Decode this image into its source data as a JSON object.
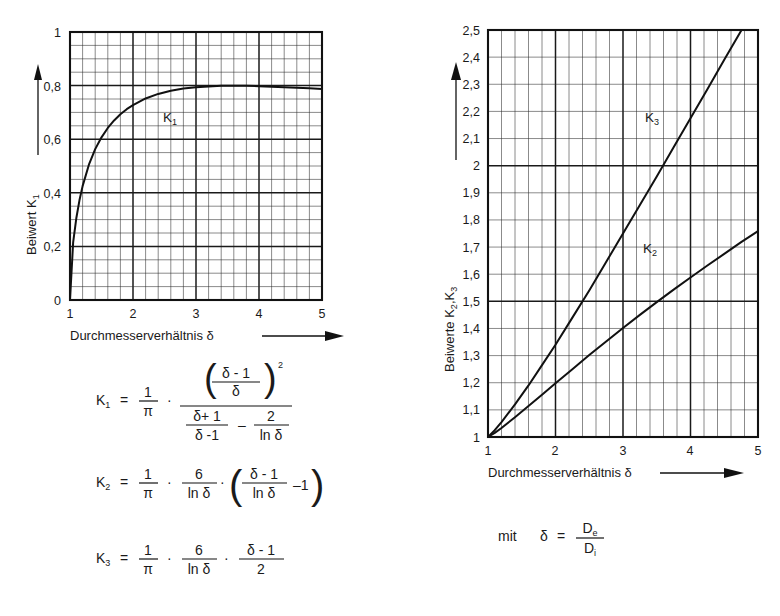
{
  "chart_data": [
    {
      "type": "line",
      "id": "left",
      "title": "",
      "xlabel": "Durchmesserverhältnis δ",
      "ylabel": "Beiwert  K₁",
      "xlim": [
        1,
        5
      ],
      "ylim": [
        0,
        1
      ],
      "grid": true,
      "x_ticks": [
        "1",
        "2",
        "3",
        "4",
        "5"
      ],
      "y_ticks": [
        "0",
        "0,2",
        "0,4",
        "0,6",
        "0,8",
        "1"
      ],
      "x_minor_step": 0.2,
      "y_minor_step": 0.05,
      "legend_position": "inline",
      "series": [
        {
          "name": "K₁",
          "label_x": 2.2,
          "label_y": 0.68,
          "x": [
            1.0,
            1.05,
            1.1,
            1.15,
            1.2,
            1.3,
            1.4,
            1.5,
            1.6,
            1.7,
            1.8,
            1.9,
            2.0,
            2.2,
            2.4,
            2.6,
            2.8,
            3.0,
            3.2,
            3.4,
            3.6,
            3.8,
            4.0,
            4.2,
            4.4,
            4.6,
            4.8,
            5.0
          ],
          "values": [
            0.0,
            0.215,
            0.305,
            0.372,
            0.425,
            0.505,
            0.563,
            0.607,
            0.642,
            0.67,
            0.693,
            0.712,
            0.727,
            0.752,
            0.769,
            0.781,
            0.789,
            0.794,
            0.797,
            0.799,
            0.799,
            0.799,
            0.798,
            0.796,
            0.794,
            0.792,
            0.79,
            0.787
          ]
        }
      ]
    },
    {
      "type": "line",
      "id": "right",
      "title": "",
      "xlabel": "Durchmesserverhältnis δ",
      "ylabel": "Beiwerte  K₂,K₃",
      "xlim": [
        1,
        5
      ],
      "ylim": [
        1,
        2.5
      ],
      "grid": true,
      "x_ticks": [
        "1",
        "2",
        "3",
        "4",
        "5"
      ],
      "y_ticks": [
        "1",
        "1,1",
        "1,2",
        "1,3",
        "1,4",
        "1,5",
        "1,6",
        "1,7",
        "1,8",
        "1,9",
        "2",
        "2,1",
        "2,2",
        "2,3",
        "2,4",
        "2,5"
      ],
      "x_minor_step": 0.2,
      "y_minor_step": 0.1,
      "legend_position": "inline",
      "series": [
        {
          "name": "K₃",
          "label_x": 3.32,
          "label_y": 2.17,
          "x": [
            1.0,
            1.1,
            1.2,
            1.4,
            1.6,
            1.8,
            2.0,
            2.25,
            2.5,
            2.75,
            3.0,
            3.25,
            3.5,
            3.75,
            4.0,
            4.25,
            4.5,
            4.75,
            5.0
          ],
          "values": [
            1.0,
            1.025,
            1.055,
            1.12,
            1.19,
            1.265,
            1.34,
            1.44,
            1.54,
            1.645,
            1.75,
            1.855,
            1.96,
            2.068,
            2.175,
            2.282,
            2.39,
            2.497,
            2.604
          ]
        },
        {
          "name": "K₂",
          "label_x": 3.3,
          "label_y": 1.66,
          "x": [
            1.0,
            1.1,
            1.2,
            1.4,
            1.6,
            1.8,
            2.0,
            2.25,
            2.5,
            2.75,
            3.0,
            3.25,
            3.5,
            3.75,
            4.0,
            4.25,
            4.5,
            4.75,
            5.0
          ],
          "values": [
            1.0,
            1.015,
            1.033,
            1.073,
            1.114,
            1.156,
            1.198,
            1.25,
            1.302,
            1.352,
            1.402,
            1.45,
            1.497,
            1.543,
            1.588,
            1.632,
            1.675,
            1.718,
            1.759
          ]
        }
      ]
    }
  ],
  "left_chart": {
    "y_axis_label": "Beiwert  K",
    "y_axis_label_sub": "1",
    "x_axis_label": "Durchmesserverhältnis δ",
    "curve_label": "K",
    "curve_label_sub": "1",
    "y_ticks": [
      "1",
      "0,8",
      "0,6",
      "0,4",
      "0,2",
      "0"
    ],
    "x_ticks": [
      "1",
      "2",
      "3",
      "4",
      "5"
    ]
  },
  "right_chart": {
    "y_axis_label": "Beiwerte  K",
    "y_axis_label_sub1": "2",
    "y_axis_label_mid": ",K",
    "y_axis_label_sub2": "3",
    "x_axis_label": "Durchmesserverhältnis δ",
    "curve_label_k3": "K",
    "curve_label_k3_sub": "3",
    "curve_label_k2": "K",
    "curve_label_k2_sub": "2",
    "y_ticks": [
      "2,5",
      "2,4",
      "2,3",
      "2,2",
      "2,1",
      "2",
      "1,9",
      "1,8",
      "1,7",
      "1,6",
      "1,5",
      "1,4",
      "1,3",
      "1,2",
      "1,1",
      "1"
    ],
    "x_ticks": [
      "1",
      "2",
      "3",
      "4",
      "5"
    ]
  },
  "formulas": {
    "k1": {
      "lhs": "K",
      "lhs_sub": "1",
      "eq": "=",
      "f1_num": "1",
      "f1_den": "π",
      "dot1": "·",
      "paren_open": "(",
      "paren_close": ")",
      "exp": "2",
      "inner_num": "δ - 1",
      "inner_den": "δ",
      "den_a_num": "δ+ 1",
      "den_a_den": "δ -1",
      "minus": "–",
      "den_b_num": "2",
      "den_b_den": "ln δ"
    },
    "k2": {
      "lhs": "K",
      "lhs_sub": "2",
      "eq": "=",
      "f1_num": "1",
      "f1_den": "π",
      "dot1": "·",
      "f2_num": "6",
      "f2_den": "ln δ",
      "dot2": "·",
      "paren_open": "(",
      "paren_close": ")",
      "f3_num": "δ - 1",
      "f3_den": "ln δ",
      "tail": "–1"
    },
    "k3": {
      "lhs": "K",
      "lhs_sub": "3",
      "eq": "=",
      "f1_num": "1",
      "f1_den": "π",
      "dot1": "·",
      "f2_num": "6",
      "f2_den": "ln δ",
      "dot2": "·",
      "f3_num": "δ - 1",
      "f3_den": "2"
    },
    "note": {
      "mit": "mit",
      "delta": "δ",
      "eq": "=",
      "num": "D",
      "num_sub": "e",
      "den": "D",
      "den_sub": "i"
    }
  }
}
